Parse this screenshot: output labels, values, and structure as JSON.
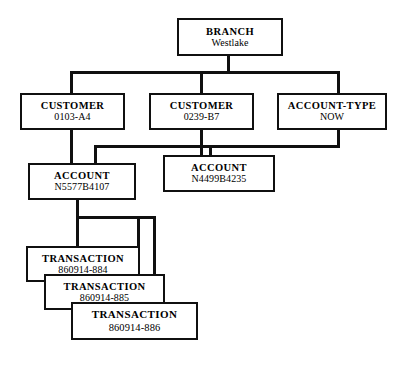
{
  "diagram": {
    "type": "hierarchical-entity-tree",
    "nodes": {
      "branch": {
        "title": "BRANCH",
        "value": "Westlake"
      },
      "customer_1": {
        "title": "CUSTOMER",
        "value": "0103-A4"
      },
      "customer_2": {
        "title": "CUSTOMER",
        "value": "0239-B7"
      },
      "account_type": {
        "title": "ACCOUNT-TYPE",
        "value": "NOW"
      },
      "account_1": {
        "title": "ACCOUNT",
        "value": "N5577B4107"
      },
      "account_2": {
        "title": "ACCOUNT",
        "value": "N4499B4235"
      },
      "transaction_1": {
        "title": "TRANSACTION",
        "value": "860914-884"
      },
      "transaction_2": {
        "title": "TRANSACTION",
        "value": "860914-885"
      },
      "transaction_3": {
        "title": "TRANSACTION",
        "value": "860914-886"
      }
    },
    "colors": {
      "line": "#101010",
      "box_border": "#101010",
      "background": "#ffffff"
    }
  }
}
